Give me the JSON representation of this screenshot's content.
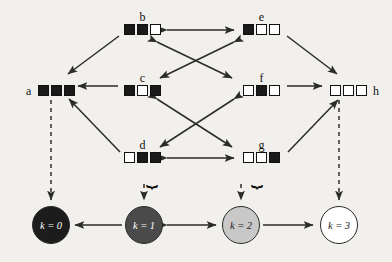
{
  "diagram": {
    "cell_states": {
      "filled": "filled-square",
      "empty": "empty-square"
    },
    "nodes": [
      {
        "id": "a",
        "label": "a",
        "label_pos": "left",
        "x": 38,
        "y": 85,
        "bits": [
          1,
          1,
          1
        ],
        "brace": false
      },
      {
        "id": "b",
        "label": "b",
        "label_pos": "top",
        "x": 124,
        "y": 24,
        "bits": [
          1,
          1,
          0
        ],
        "brace": false
      },
      {
        "id": "c",
        "label": "c",
        "label_pos": "top",
        "x": 124,
        "y": 85,
        "bits": [
          1,
          0,
          1
        ],
        "brace": false
      },
      {
        "id": "d",
        "label": "d",
        "label_pos": "top",
        "x": 124,
        "y": 152,
        "bits": [
          0,
          1,
          1
        ],
        "brace": true,
        "brace_side": "right"
      },
      {
        "id": "e",
        "label": "e",
        "label_pos": "top",
        "x": 243,
        "y": 24,
        "bits": [
          1,
          0,
          0
        ],
        "brace": false
      },
      {
        "id": "f",
        "label": "f",
        "label_pos": "top",
        "x": 243,
        "y": 85,
        "bits": [
          0,
          1,
          0
        ],
        "brace": false
      },
      {
        "id": "g",
        "label": "g",
        "label_pos": "top",
        "x": 243,
        "y": 152,
        "bits": [
          0,
          0,
          1
        ],
        "brace": true,
        "brace_side": "left"
      },
      {
        "id": "h",
        "label": "h",
        "label_pos": "right",
        "x": 330,
        "y": 85,
        "bits": [
          0,
          0,
          0
        ],
        "brace": false
      }
    ],
    "k_classes": [
      {
        "id": "k0",
        "label": "k = 0",
        "x": 32,
        "y": 206,
        "fill": "#1c1c1c",
        "text_color": "#ffffff"
      },
      {
        "id": "k1",
        "label": "k = 1",
        "x": 125,
        "y": 206,
        "fill": "#4a4a4a",
        "text_color": "#ffffff"
      },
      {
        "id": "k2",
        "label": "k = 2",
        "x": 222,
        "y": 206,
        "fill": "#c8c8c8",
        "text_color": "#1c1c1c"
      },
      {
        "id": "k3",
        "label": "k = 3",
        "x": 320,
        "y": 206,
        "fill": "#ffffff",
        "text_color": "#1c1c1c"
      }
    ],
    "edges": [
      {
        "from": "b",
        "to": "a",
        "style": "solid",
        "direction": "one-way"
      },
      {
        "from": "c",
        "to": "a",
        "style": "solid",
        "direction": "one-way"
      },
      {
        "from": "d",
        "to": "a",
        "style": "solid",
        "direction": "one-way"
      },
      {
        "from": "b",
        "to": "e",
        "style": "solid",
        "direction": "two-way"
      },
      {
        "from": "b",
        "to": "f",
        "style": "solid",
        "direction": "two-way"
      },
      {
        "from": "e",
        "to": "c",
        "style": "solid",
        "direction": "two-way"
      },
      {
        "from": "c",
        "to": "g",
        "style": "solid",
        "direction": "two-way"
      },
      {
        "from": "f",
        "to": "d",
        "style": "solid",
        "direction": "two-way"
      },
      {
        "from": "d",
        "to": "g",
        "style": "solid",
        "direction": "two-way"
      },
      {
        "from": "e",
        "to": "h",
        "style": "solid",
        "direction": "one-way"
      },
      {
        "from": "f",
        "to": "h",
        "style": "solid",
        "direction": "one-way"
      },
      {
        "from": "g",
        "to": "h",
        "style": "solid",
        "direction": "one-way"
      },
      {
        "from": "a",
        "to": "k0",
        "style": "dashed",
        "direction": "one-way"
      },
      {
        "from": "d",
        "to": "k1",
        "style": "dashed",
        "direction": "one-way"
      },
      {
        "from": "g",
        "to": "k2",
        "style": "dashed",
        "direction": "one-way"
      },
      {
        "from": "h",
        "to": "k3",
        "style": "dashed",
        "direction": "one-way"
      },
      {
        "from": "k1",
        "to": "k0",
        "style": "solid",
        "direction": "one-way"
      },
      {
        "from": "k1",
        "to": "k2",
        "style": "solid",
        "direction": "two-way"
      },
      {
        "from": "k2",
        "to": "k3",
        "style": "solid",
        "direction": "one-way"
      }
    ],
    "colors": {
      "background": "#f2f0ec",
      "stroke": "#2b2b2b",
      "cell_on": "#1a1a1a",
      "cell_off": "#ffffff"
    }
  }
}
